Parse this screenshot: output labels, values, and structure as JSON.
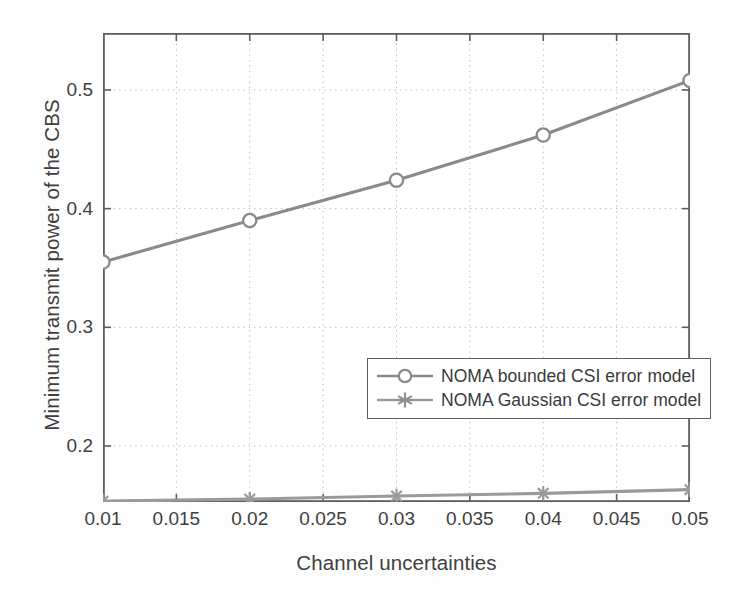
{
  "chart_data": {
    "type": "line",
    "title": "",
    "xlabel": "Channel uncertainties",
    "ylabel": "Minimum transmit power of the CBS",
    "x": [
      0.01,
      0.02,
      0.03,
      0.04,
      0.05
    ],
    "xlim": [
      0.01,
      0.05
    ],
    "ylim": [
      0.1528,
      0.548
    ],
    "xticks": [
      "0.01",
      "0.015",
      "0.02",
      "0.025",
      "0.03",
      "0.035",
      "0.04",
      "0.045",
      "0.05"
    ],
    "xtick_values": [
      0.01,
      0.015,
      0.02,
      0.025,
      0.03,
      0.035,
      0.04,
      0.045,
      0.05
    ],
    "yticks": [
      "0.2",
      "0.3",
      "0.4",
      "0.5"
    ],
    "ytick_values": [
      0.2,
      0.3,
      0.4,
      0.5
    ],
    "grid": true,
    "grid_style": "dotted",
    "legend_position": "center-right",
    "series": [
      {
        "name": "NOMA bounded CSI error model",
        "marker": "circle",
        "color": "#8a8a8a",
        "values": [
          0.355,
          0.39,
          0.424,
          0.462,
          0.508
        ]
      },
      {
        "name": "NOMA Gaussian CSI error model",
        "marker": "asterisk",
        "color": "#9a9a9a",
        "values": [
          0.1535,
          0.1552,
          0.1578,
          0.1601,
          0.1632
        ]
      }
    ]
  },
  "axes": {
    "x_title": "Channel uncertainties",
    "y_title": "Minimum transmit power of the CBS"
  },
  "legend": {
    "entries": [
      {
        "label": "NOMA bounded CSI error model",
        "marker": "circle-marker"
      },
      {
        "label": "NOMA Gaussian CSI error model",
        "marker": "asterisk-marker"
      }
    ]
  },
  "colors": {
    "series_bounded": "#8a8a8a",
    "series_gaussian": "#9a9a9a",
    "axis": "#5d5d5d",
    "grid": "#b4b4b4",
    "text": "#3a3a3a",
    "background": "#fdfdfd"
  }
}
